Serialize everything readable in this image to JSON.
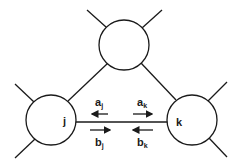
{
  "diagram": {
    "title": "",
    "nodes": [
      {
        "id": "top",
        "label": ""
      },
      {
        "id": "j",
        "label": "j"
      },
      {
        "id": "k",
        "label": "k"
      }
    ],
    "edges": [
      {
        "from": "top",
        "to": "j"
      },
      {
        "from": "top",
        "to": "k"
      },
      {
        "from": "j",
        "to": "k"
      }
    ],
    "waves": [
      {
        "base": "a",
        "sub": "j",
        "direction": "left",
        "side": "above"
      },
      {
        "base": "a",
        "sub": "k",
        "direction": "right",
        "side": "above"
      },
      {
        "base": "b",
        "sub": "j",
        "direction": "right",
        "side": "below"
      },
      {
        "base": "b",
        "sub": "k",
        "direction": "left",
        "side": "below"
      }
    ],
    "colors": {
      "stroke": "#1a1a1a",
      "background": "#ffffff"
    }
  }
}
